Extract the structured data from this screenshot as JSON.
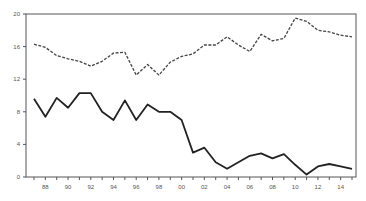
{
  "chart_data": {
    "type": "line",
    "title": "",
    "xlabel": "",
    "ylabel": "",
    "x": [
      1987,
      1988,
      1989,
      1990,
      1991,
      1992,
      1993,
      1994,
      1995,
      1996,
      1997,
      1998,
      1999,
      2000,
      2001,
      2002,
      2003,
      2004,
      2005,
      2006,
      2007,
      2008,
      2009,
      2010,
      2011,
      2012,
      2013,
      2014,
      2015
    ],
    "x_tick_labels": [
      "88",
      "90",
      "92",
      "94",
      "96",
      "98",
      "00",
      "02",
      "04",
      "06",
      "08",
      "10",
      "12",
      "14"
    ],
    "y_tick_labels": [
      "0",
      "4",
      "8",
      "12",
      "16",
      "20"
    ],
    "ylim": [
      0,
      20
    ],
    "grid": false,
    "legend": null,
    "series": [
      {
        "name": "dashed series",
        "style": "dashed",
        "color": "#444444",
        "values": [
          16.3,
          15.9,
          14.9,
          14.5,
          14.2,
          13.6,
          14.2,
          15.2,
          15.3,
          12.5,
          13.8,
          12.5,
          14.1,
          14.8,
          15.1,
          16.2,
          16.2,
          17.2,
          16.2,
          15.4,
          17.5,
          16.7,
          17.0,
          19.5,
          19.1,
          18.0,
          17.8,
          17.4,
          17.2
        ]
      },
      {
        "name": "solid series",
        "style": "solid",
        "color": "#222222",
        "values": [
          9.6,
          7.4,
          9.7,
          8.5,
          10.3,
          10.3,
          8.0,
          7.0,
          9.4,
          7.0,
          8.9,
          8.0,
          8.0,
          7.0,
          3.0,
          3.6,
          1.8,
          1.0,
          1.8,
          2.6,
          2.9,
          2.3,
          2.8,
          1.5,
          0.3,
          1.3,
          1.6,
          1.3,
          1.0
        ]
      }
    ]
  }
}
